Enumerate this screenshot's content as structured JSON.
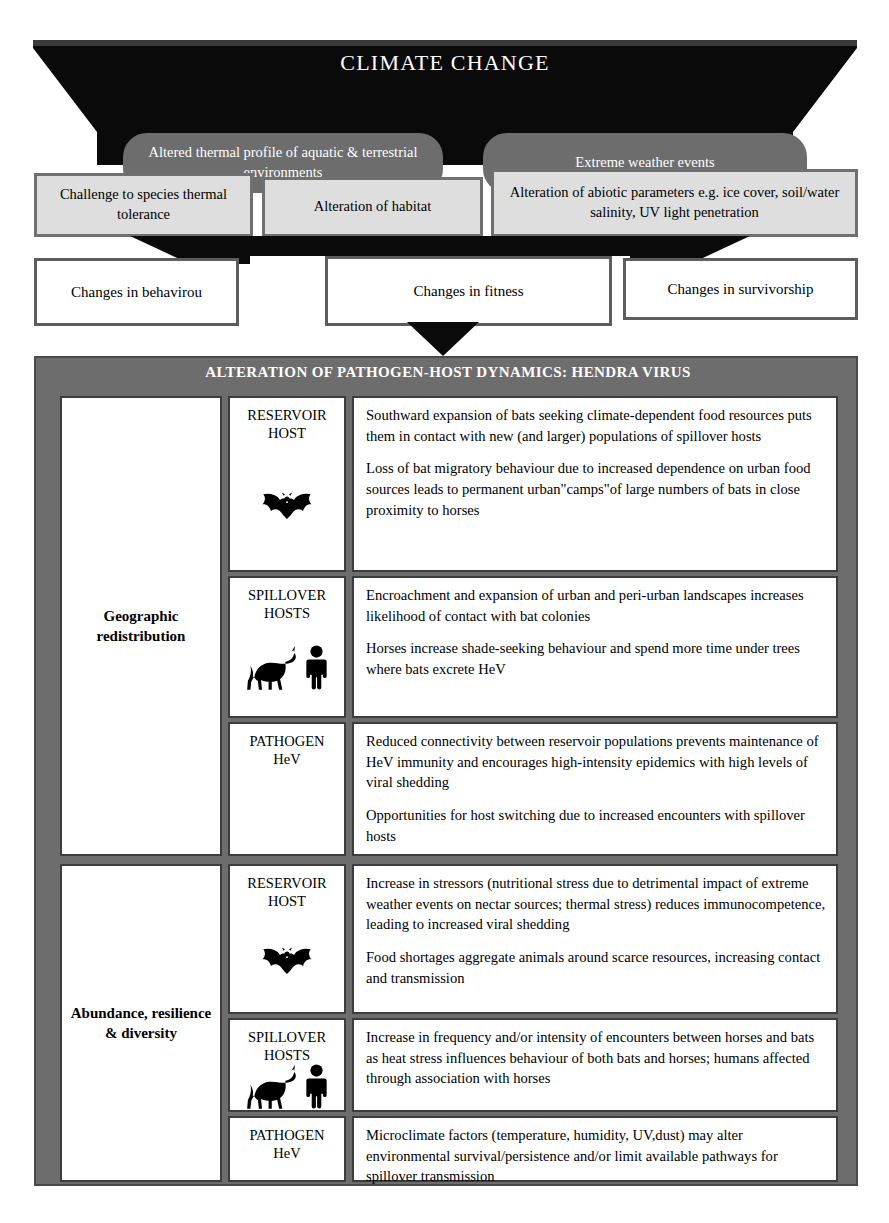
{
  "banner": {
    "title": "CLIMATE CHANGE",
    "pills": [
      "Altered thermal profile of aquatic & terrestrial environments",
      "Extreme weather events"
    ]
  },
  "grey_row": [
    "Challenge to species thermal tolerance",
    "Alteration of habitat",
    "Alteration of abiotic parameters e.g. ice cover, soil/water salinity, UV light penetration"
  ],
  "white_row": [
    "Changes in behavirou",
    "Changes in fitness",
    "Changes in survivorship"
  ],
  "table": {
    "title": "ALTERATION OF PATHOGEN-HOST DYNAMICS: HENDRA VIRUS",
    "sections": [
      {
        "category": "Geographic redistribution",
        "rows": [
          {
            "host": "RESERVOIR\nHOST",
            "icon": "bat-icon",
            "paragraphs": [
              "Southward expansion of bats seeking climate-dependent food resources puts them in contact with new (and larger) populations of spillover hosts",
              "Loss of bat migratory behaviour due to increased dependence on urban food sources leads to permanent urban\"camps\"of large numbers of bats in close proximity to horses"
            ]
          },
          {
            "host": "SPILLOVER\nHOSTS",
            "icon": "horse-human-icon",
            "paragraphs": [
              "Encroachment and expansion of urban and peri-urban landscapes increases likelihood of contact with bat colonies",
              "Horses increase shade-seeking behaviour and spend more time under trees where bats excrete HeV"
            ]
          },
          {
            "host": "PATHOGEN\nHeV",
            "icon": "none",
            "paragraphs": [
              "Reduced connectivity between reservoir populations prevents maintenance of HeV immunity and encourages high-intensity epidemics with high levels of viral shedding",
              "Opportunities for host switching due to increased encounters with spillover hosts"
            ]
          }
        ]
      },
      {
        "category": "Abundance, resilience & diversity",
        "rows": [
          {
            "host": "RESERVOIR\nHOST",
            "icon": "bat-icon",
            "paragraphs": [
              "Increase in stressors (nutritional stress due to detrimental impact of extreme weather events on nectar sources; thermal stress) reduces immunocompetence, leading to increased viral shedding",
              "Food shortages aggregate animals around scarce resources, increasing contact and transmission"
            ]
          },
          {
            "host": "SPILLOVER\nHOSTS",
            "icon": "horse-human-icon",
            "paragraphs": [
              "Increase in frequency and/or intensity of encounters between horses and bats as heat stress influences behaviour of both bats and horses; humans affected through association with horses"
            ]
          },
          {
            "host": "PATHOGEN\nHeV",
            "icon": "none",
            "paragraphs": [
              "Microclimate factors (temperature, humidity, UV,dust) may alter environmental survival/persistence and/or limit available pathways for spillover transmission"
            ]
          }
        ]
      }
    ]
  },
  "colors": {
    "banner_black": "#0a0a0a",
    "pill_grey": "#6d6d6d",
    "light_grey_box": "#dedede",
    "table_grey": "#6d6d6d",
    "border_dark": "#3d3d3d"
  }
}
